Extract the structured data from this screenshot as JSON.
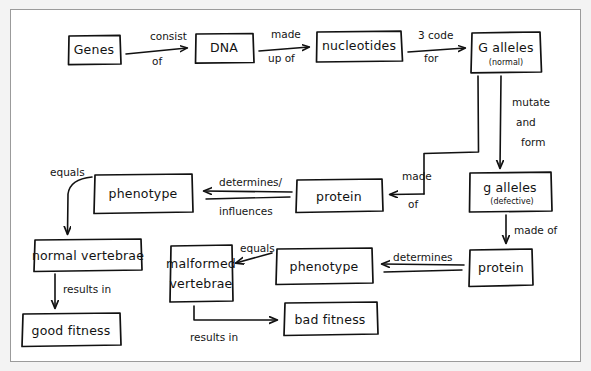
{
  "diagram": {
    "kind": "hand-drawn-concept-map",
    "ink_color": "#111111",
    "paper_color": "#ffffff",
    "frame_color": "#9b9b9b",
    "nodes": [
      {
        "id": "genes",
        "label": "Genes",
        "sub": ""
      },
      {
        "id": "dna",
        "label": "DNA",
        "sub": ""
      },
      {
        "id": "nucleotides",
        "label": "nucleotides",
        "sub": ""
      },
      {
        "id": "g_alleles_normal",
        "label": "G alleles",
        "sub": "(normal)"
      },
      {
        "id": "g_alleles_defect",
        "label": "g alleles",
        "sub": "(defective)"
      },
      {
        "id": "protein_right",
        "label": "protein",
        "sub": ""
      },
      {
        "id": "protein_mid",
        "label": "protein",
        "sub": ""
      },
      {
        "id": "phenotype_top",
        "label": "phenotype",
        "sub": ""
      },
      {
        "id": "phenotype_bottom",
        "label": "phenotype",
        "sub": ""
      },
      {
        "id": "normal_vertebrae",
        "label": "normal vertebrae",
        "sub": ""
      },
      {
        "id": "malformed_vert_l1",
        "label": "malformed",
        "sub": "vertebrae"
      },
      {
        "id": "good_fitness",
        "label": "good fitness",
        "sub": ""
      },
      {
        "id": "bad_fitness",
        "label": "bad fitness",
        "sub": ""
      }
    ],
    "edges": [
      {
        "id": "e1",
        "from": "genes",
        "to": "dna",
        "label_line1": "consist",
        "label_line2": "of"
      },
      {
        "id": "e2",
        "from": "dna",
        "to": "nucleotides",
        "label_line1": "made",
        "label_line2": "up of"
      },
      {
        "id": "e3",
        "from": "nucleotides",
        "to": "g_alleles_normal",
        "label_line1": "3 code",
        "label_line2": "for"
      },
      {
        "id": "e4",
        "from": "g_alleles_normal",
        "to": "g_alleles_defect",
        "label_line1": "mutate",
        "label_line2": "and",
        "label_line3": "form"
      },
      {
        "id": "e5",
        "from": "g_alleles_defect",
        "to": "protein_right",
        "label_line1": "made of",
        "label_line2": ""
      },
      {
        "id": "e6",
        "from": "protein_right",
        "to": "phenotype_bottom",
        "label_line1": "determines",
        "label_line2": ""
      },
      {
        "id": "e7",
        "from": "phenotype_bottom",
        "to": "malformed_vert_l1",
        "label_line1": "equals",
        "label_line2": ""
      },
      {
        "id": "e8",
        "from": "malformed_vert_l1",
        "to": "bad_fitness",
        "label_line1": "results in",
        "label_line2": ""
      },
      {
        "id": "e9",
        "from": "g_alleles_normal",
        "to": "protein_mid",
        "label_line1": "made",
        "label_line2": "of"
      },
      {
        "id": "e10",
        "from": "protein_mid",
        "to": "phenotype_top",
        "label_line1": "determines/",
        "label_line2": "influences"
      },
      {
        "id": "e11",
        "from": "phenotype_top",
        "to": "normal_vertebrae",
        "label_line1": "equals",
        "label_line2": ""
      },
      {
        "id": "e12",
        "from": "normal_vertebrae",
        "to": "good_fitness",
        "label_line1": "results in",
        "label_line2": ""
      }
    ],
    "labels": {
      "consist": "consist",
      "of_1": "of",
      "made": "made",
      "up_of": "up of",
      "three_code": "3 code",
      "for": "for",
      "mutate": "mutate",
      "and": "and",
      "form": "form",
      "made_of_right": "made of",
      "determines_bottom": "determines",
      "equals_bottom": "equals",
      "results_in_bottom": "results in",
      "made_mid": "made",
      "of_mid": "of",
      "determines_slash": "determines/",
      "influences": "influences",
      "equals_top": "equals",
      "results_in_top": "results in"
    }
  }
}
